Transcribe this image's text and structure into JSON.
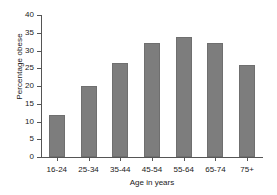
{
  "chart_data": {
    "type": "bar",
    "title": "",
    "xlabel": "Age in years",
    "ylabel": "Percentage obese",
    "categories": [
      "16-24",
      "25-34",
      "35-44",
      "45-54",
      "55-64",
      "65-74",
      "75+"
    ],
    "values": [
      11.7,
      20.0,
      26.5,
      32.0,
      33.7,
      32.0,
      26.0
    ],
    "ylim": [
      0,
      40
    ],
    "ytick_labels": [
      "0",
      "5",
      "10",
      "15",
      "20",
      "25",
      "30",
      "35",
      "40"
    ],
    "ytick_values": [
      0,
      5,
      10,
      15,
      20,
      25,
      30,
      35,
      40
    ],
    "grid": false,
    "legend": false,
    "bar_color": "#7d7d7d",
    "axis_color": "#555555",
    "text_color": "#1a1a1a",
    "background_color": "#ffffff"
  }
}
